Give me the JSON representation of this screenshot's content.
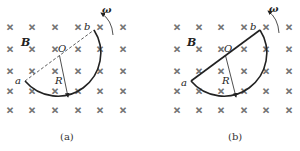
{
  "panels": [
    {
      "id": "a",
      "caption": "(a)",
      "diameter_style": "dashed",
      "labels": {
        "field": "B",
        "center": "O",
        "radius": "R",
        "end_a": "a",
        "end_b": "b",
        "omega": "ω"
      }
    },
    {
      "id": "b",
      "caption": "(b)",
      "diameter_style": "solid",
      "labels": {
        "field": "B",
        "center": "O",
        "radius": "R",
        "end_a": "a",
        "end_b": "b",
        "omega": "ω"
      }
    }
  ],
  "field_symbol": "×",
  "colors": {
    "ink": "#222222",
    "cross": "#777777",
    "background": "#ffffff"
  }
}
